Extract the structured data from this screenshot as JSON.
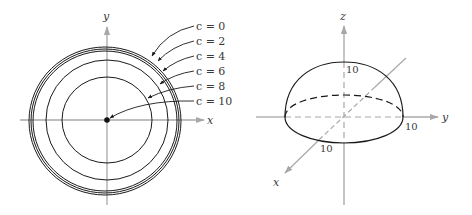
{
  "figure_left": {
    "title": "Level curves of f(x,y)",
    "axes": {
      "x_label": "x",
      "y_label": "y"
    },
    "center_point": {
      "x": 107,
      "y": 120
    },
    "level_curves": [
      {
        "label": "c = 0",
        "c": 0,
        "rx": 76,
        "ry": 74,
        "cx": 105,
        "cy": 121
      },
      {
        "label": "c = 2",
        "c": 2,
        "rx": 74,
        "ry": 72,
        "cx": 105,
        "cy": 121
      },
      {
        "label": "c = 4",
        "c": 4,
        "rx": 72,
        "ry": 70,
        "cx": 105,
        "cy": 121
      },
      {
        "label": "c = 6",
        "c": 6,
        "rx": 61,
        "ry": 60,
        "cx": 107,
        "cy": 120
      },
      {
        "label": "c = 8",
        "c": 8,
        "rx": 45,
        "ry": 43,
        "cx": 107,
        "cy": 120
      },
      {
        "label": "c = 10",
        "c": 10,
        "rx": 0,
        "ry": 0,
        "cx": 107,
        "cy": 120
      }
    ]
  },
  "figure_right": {
    "title": "Hemisphere surface",
    "axes": {
      "x_label": "x",
      "y_label": "y",
      "z_label": "z"
    },
    "tick_labels": {
      "z_top": "10",
      "y_right": "10",
      "x_front": "10"
    }
  },
  "colors": {
    "curve": "#1a1a1a",
    "axis": "#a8a8a8",
    "text": "#3a3a3a"
  }
}
